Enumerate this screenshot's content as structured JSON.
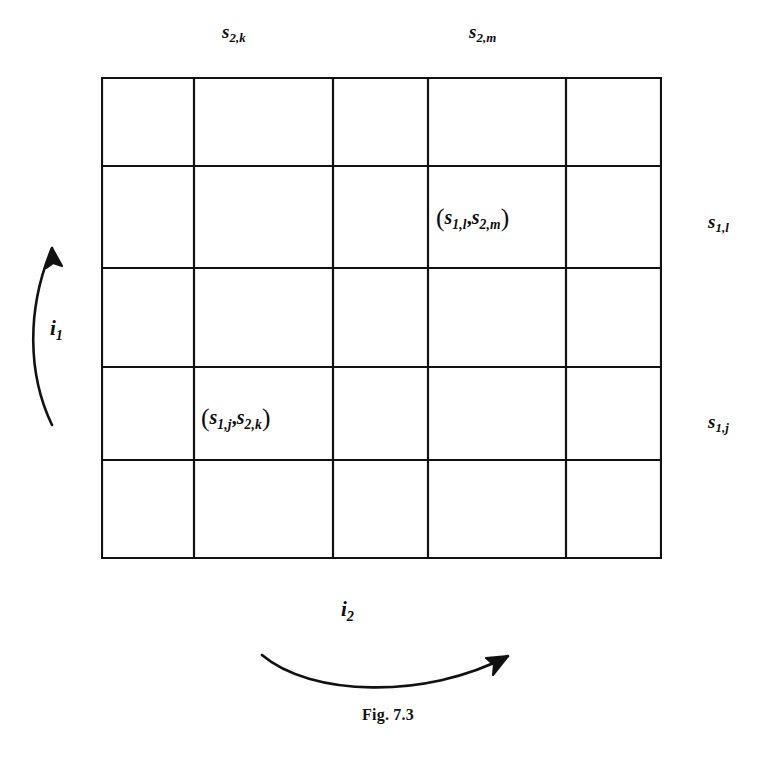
{
  "figure": {
    "caption": "Fig. 7.3",
    "grid": {
      "rows": 5,
      "cols": 5,
      "col_boundaries_px": [
        101,
        194,
        333,
        428,
        566,
        662
      ],
      "row_boundaries_px": [
        77,
        166,
        268,
        367,
        460,
        559
      ],
      "line_color": "#111111"
    },
    "top_labels": [
      {
        "id": "s2k",
        "text_base": "s",
        "sub1": "2,",
        "sub2": "k",
        "column_index": 1
      },
      {
        "id": "s2m",
        "text_base": "s",
        "sub1": "2,",
        "sub2": "m",
        "column_index": 3
      }
    ],
    "right_labels": [
      {
        "id": "s1l",
        "text_base": "s",
        "sub1": "1,",
        "sub2": "l",
        "row_index": 1
      },
      {
        "id": "s1j",
        "text_base": "s",
        "sub1": "1,",
        "sub2": "j",
        "row_index": 3
      }
    ],
    "cell_labels": [
      {
        "id": "cell-s1l-s2m",
        "open": "(",
        "a_base": "s",
        "a_sub1": "1,",
        "a_sub2": "l",
        "comma": ",",
        "b_base": "s",
        "b_sub1": "2,",
        "b_sub2": "m",
        "close": ")",
        "row_index": 1,
        "column_index": 3
      },
      {
        "id": "cell-s1j-s2k",
        "open": "(",
        "a_base": "s",
        "a_sub1": "1,",
        "a_sub2": "j",
        "comma": ",",
        "b_base": "s",
        "b_sub1": "2,",
        "b_sub2": "k",
        "close": ")",
        "row_index": 3,
        "column_index": 1
      }
    ],
    "arrows": [
      {
        "id": "i1",
        "label_base": "i",
        "label_sub": "1",
        "direction": "up",
        "position": "left-of-grid"
      },
      {
        "id": "i2",
        "label_base": "i",
        "label_sub": "2",
        "direction": "right",
        "position": "below-grid"
      }
    ]
  }
}
